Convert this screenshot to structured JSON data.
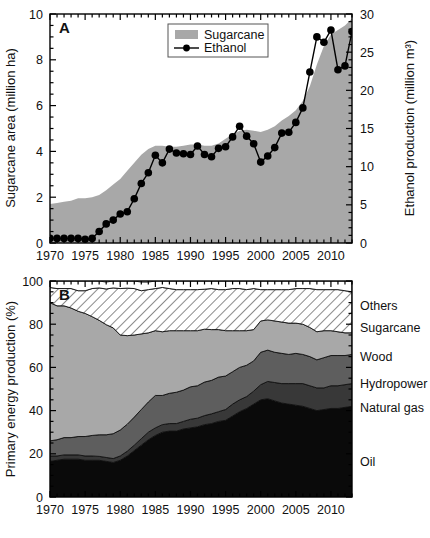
{
  "figure": {
    "panels": [
      "A",
      "B"
    ],
    "width": 430,
    "height": 538
  },
  "panelA": {
    "label": "A",
    "ylabel_left": "Sugarcane area (million ha)",
    "ylabel_right": "Ethanol production (million m³)",
    "legend": {
      "sugarcane": "Sugarcane",
      "ethanol": "Ethanol"
    }
  },
  "panelB": {
    "label": "B",
    "ylabel": "Primary energy production (%)",
    "series_labels": {
      "others": "Others",
      "sugarcane": "Sugarcane",
      "wood": "Wood",
      "hydropower": "Hydropower",
      "natural_gas": "Natural gas",
      "oil": "Oil"
    }
  },
  "colors": {
    "sugarcane_area": "#a8a8a8",
    "ethanol_line": "#000000",
    "oil": "#0a0a0a",
    "natural_gas": "#383838",
    "hydropower": "#5e5e5e",
    "wood": "#a8a8a8",
    "sugarcane_hatch": "#ffffff",
    "others": "#ffffff",
    "axis": "#000000"
  },
  "chart_data": [
    {
      "type": "area",
      "id": "panel-a",
      "title": "A",
      "xlabel": "",
      "ylabel": "Sugarcane area (million ha)",
      "ylabel2": "Ethanol production (million m³)",
      "xlim": [
        1970,
        2013
      ],
      "ylim": [
        0,
        10
      ],
      "ylim2": [
        0,
        30
      ],
      "xticks": [
        1970,
        1975,
        1980,
        1985,
        1990,
        1995,
        2000,
        2005,
        2010
      ],
      "yticks": [
        0,
        2,
        4,
        6,
        8,
        10
      ],
      "yticks2": [
        0,
        5,
        10,
        15,
        20,
        25,
        30
      ],
      "minor_tick_step": 1,
      "grid": false,
      "legend_position": "top-center",
      "x": [
        1970,
        1971,
        1972,
        1973,
        1974,
        1975,
        1976,
        1977,
        1978,
        1979,
        1980,
        1981,
        1982,
        1983,
        1984,
        1985,
        1986,
        1987,
        1988,
        1989,
        1990,
        1991,
        1992,
        1993,
        1994,
        1995,
        1996,
        1997,
        1998,
        1999,
        2000,
        2001,
        2002,
        2003,
        2004,
        2005,
        2006,
        2007,
        2008,
        2009,
        2010,
        2011,
        2012,
        2013
      ],
      "series": [
        {
          "name": "Sugarcane",
          "axis": "left",
          "style": "filled-area",
          "units": "million ha",
          "values": [
            1.7,
            1.75,
            1.8,
            1.85,
            1.95,
            1.95,
            2.0,
            2.1,
            2.3,
            2.55,
            2.8,
            3.15,
            3.5,
            3.85,
            4.1,
            4.25,
            4.25,
            4.2,
            4.2,
            4.25,
            4.3,
            4.3,
            4.25,
            4.25,
            4.35,
            4.55,
            4.75,
            4.9,
            4.95,
            4.9,
            4.85,
            4.95,
            5.1,
            5.35,
            5.55,
            5.8,
            6.2,
            6.85,
            7.8,
            8.6,
            9.1,
            9.3,
            9.5,
            9.8
          ]
        },
        {
          "name": "Ethanol",
          "axis": "right",
          "style": "line-markers",
          "units": "million m³",
          "values": [
            0.6,
            0.6,
            0.6,
            0.6,
            0.6,
            0.5,
            0.6,
            1.5,
            2.5,
            3.0,
            3.8,
            4.1,
            5.8,
            7.8,
            9.2,
            11.5,
            10.5,
            12.3,
            11.8,
            11.7,
            11.6,
            12.7,
            11.6,
            11.3,
            12.4,
            12.6,
            13.9,
            15.3,
            14.0,
            13.0,
            10.6,
            11.4,
            12.5,
            14.4,
            14.5,
            15.8,
            17.7,
            22.4,
            27.0,
            26.3,
            27.9,
            22.7,
            23.2,
            27.7
          ]
        }
      ]
    },
    {
      "type": "area",
      "id": "panel-b",
      "title": "B",
      "stacked": true,
      "xlabel": "",
      "ylabel": "Primary energy production (%)",
      "xlim": [
        1970,
        2013
      ],
      "ylim": [
        0,
        100
      ],
      "xticks": [
        1970,
        1975,
        1980,
        1985,
        1990,
        1995,
        2000,
        2005,
        2010
      ],
      "yticks": [
        0,
        20,
        40,
        60,
        80,
        100
      ],
      "minor_tick_step": 1,
      "grid": false,
      "legend_position": "right-inline",
      "x": [
        1970,
        1971,
        1972,
        1973,
        1974,
        1975,
        1976,
        1977,
        1978,
        1979,
        1980,
        1981,
        1982,
        1983,
        1984,
        1985,
        1986,
        1987,
        1988,
        1989,
        1990,
        1991,
        1992,
        1993,
        1994,
        1995,
        1996,
        1997,
        1998,
        1999,
        2000,
        2001,
        2002,
        2003,
        2004,
        2005,
        2006,
        2007,
        2008,
        2009,
        2010,
        2011,
        2012,
        2013
      ],
      "series": [
        {
          "name": "Oil",
          "values": [
            16.5,
            17.0,
            17.5,
            17.5,
            17.5,
            17.0,
            17.0,
            17.0,
            16.5,
            16.0,
            17.0,
            19.0,
            21.5,
            24.0,
            26.5,
            28.5,
            30.0,
            30.5,
            30.5,
            31.5,
            32.0,
            32.5,
            33.5,
            34.0,
            35.0,
            35.5,
            37.5,
            39.5,
            41.0,
            43.0,
            45.0,
            45.5,
            44.5,
            43.5,
            43.0,
            42.5,
            42.0,
            41.0,
            40.0,
            40.5,
            41.0,
            41.0,
            41.5,
            42.0
          ]
        },
        {
          "name": "Natural gas",
          "values": [
            2.5,
            2.0,
            2.0,
            2.0,
            2.0,
            2.0,
            2.0,
            1.8,
            1.8,
            1.8,
            2.0,
            2.2,
            2.5,
            3.0,
            3.5,
            3.5,
            3.5,
            3.5,
            3.5,
            3.5,
            4.0,
            4.0,
            4.2,
            4.5,
            4.5,
            5.0,
            5.5,
            5.5,
            5.5,
            6.0,
            7.0,
            8.0,
            8.5,
            9.0,
            9.5,
            10.0,
            10.5,
            10.5,
            10.5,
            10.0,
            10.5,
            10.5,
            10.5,
            10.5
          ]
        },
        {
          "name": "Hydropower",
          "values": [
            7.0,
            7.5,
            8.0,
            8.0,
            8.5,
            9.0,
            9.5,
            10.0,
            10.5,
            11.5,
            12.0,
            12.5,
            13.0,
            13.5,
            14.0,
            15.0,
            13.5,
            14.0,
            14.5,
            14.5,
            15.0,
            15.0,
            15.5,
            15.5,
            16.0,
            15.5,
            15.0,
            15.0,
            14.5,
            14.0,
            15.0,
            14.5,
            14.0,
            14.0,
            13.5,
            14.0,
            13.5,
            13.5,
            13.0,
            14.0,
            14.0,
            14.0,
            13.5,
            13.5
          ]
        },
        {
          "name": "Wood",
          "values": [
            64.0,
            62.0,
            61.0,
            60.0,
            58.0,
            57.0,
            55.0,
            53.0,
            51.0,
            49.0,
            44.0,
            41.0,
            38.0,
            35.0,
            32.0,
            30.0,
            29.5,
            29.0,
            28.5,
            27.5,
            26.0,
            25.5,
            24.5,
            23.5,
            22.0,
            21.0,
            19.0,
            17.0,
            16.0,
            14.5,
            14.5,
            14.0,
            14.5,
            14.5,
            14.5,
            14.0,
            14.0,
            13.5,
            13.0,
            12.5,
            11.5,
            11.0,
            10.5,
            10.0
          ]
        },
        {
          "name": "Sugarcane",
          "values": [
            7.0,
            8.0,
            8.0,
            9.0,
            9.5,
            10.5,
            13.0,
            15.0,
            16.5,
            18.5,
            21.5,
            22.0,
            21.5,
            20.0,
            20.0,
            19.5,
            20.5,
            19.5,
            19.0,
            19.0,
            19.0,
            19.0,
            18.5,
            19.0,
            18.5,
            19.0,
            19.5,
            19.5,
            19.0,
            19.0,
            14.5,
            14.0,
            14.5,
            15.0,
            15.5,
            16.0,
            16.5,
            18.0,
            19.5,
            19.0,
            19.0,
            19.5,
            19.5,
            19.0
          ]
        },
        {
          "name": "Others",
          "values": [
            3.0,
            3.5,
            3.5,
            3.5,
            4.5,
            4.5,
            3.5,
            3.2,
            3.2,
            3.2,
            3.5,
            3.3,
            3.5,
            4.0,
            3.5,
            3.5,
            3.0,
            3.5,
            4.0,
            4.0,
            4.0,
            4.0,
            3.8,
            3.5,
            4.0,
            4.0,
            3.5,
            3.5,
            4.0,
            3.5,
            4.0,
            4.0,
            4.0,
            4.0,
            4.0,
            3.5,
            3.5,
            3.5,
            4.0,
            4.0,
            4.0,
            4.0,
            4.5,
            5.0
          ]
        }
      ]
    }
  ]
}
